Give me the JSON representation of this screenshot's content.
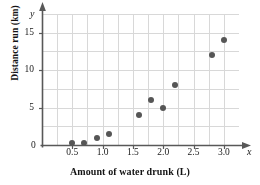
{
  "chart_data": {
    "type": "scatter",
    "title": "",
    "xlabel": "Amount of water drunk (L)",
    "ylabel": "Distance run (km)",
    "x_axis_variable": "x",
    "y_axis_variable": "y",
    "origin_label": "0",
    "xlim": [
      0,
      3.25
    ],
    "ylim": [
      0,
      17.5
    ],
    "xticks": [
      0.5,
      1.0,
      1.5,
      2.0,
      2.5,
      3.0
    ],
    "xticklabels": [
      "0.5",
      "1.0",
      "1.5",
      "2.0",
      "2.5",
      "3.0"
    ],
    "yticks": [
      5,
      10,
      15
    ],
    "yticklabels": [
      "5",
      "10",
      "15"
    ],
    "grid": true,
    "grid_x_step": 0.25,
    "grid_y_step": 2.5,
    "legend": null,
    "marker_color": "#565656",
    "grid_color": "#d8d8d8",
    "axis_color": "#585858",
    "points": [
      {
        "x": 0.5,
        "y": 0.3
      },
      {
        "x": 0.7,
        "y": 0.3
      },
      {
        "x": 0.9,
        "y": 1.0
      },
      {
        "x": 1.1,
        "y": 1.5
      },
      {
        "x": 1.6,
        "y": 4.0
      },
      {
        "x": 1.8,
        "y": 6.0
      },
      {
        "x": 2.0,
        "y": 5.0
      },
      {
        "x": 2.2,
        "y": 8.0
      },
      {
        "x": 2.8,
        "y": 12.0
      },
      {
        "x": 3.0,
        "y": 14.0
      }
    ]
  }
}
